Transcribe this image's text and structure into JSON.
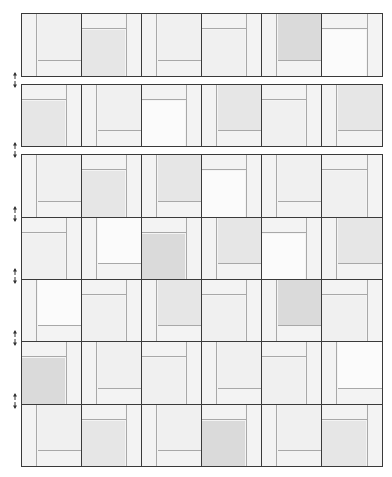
{
  "diagram": {
    "title": "",
    "colors": {
      "outline": "#3a3a3a",
      "seam": "#a8a8a8",
      "strip": "#f3f3f3",
      "shade_white": "#fbfbfb",
      "shade_light": "#f0f0f0",
      "shade_medium": "#e6e6e6",
      "shade_dark": "#dadada"
    },
    "rows": [
      {
        "top": 13,
        "height": 64,
        "blocks": [
          {
            "layout": "left-bottom",
            "fill": "shade_light"
          },
          {
            "layout": "top-right",
            "fill": "shade_medium"
          },
          {
            "layout": "left-bottom",
            "fill": "shade_light"
          },
          {
            "layout": "top-right",
            "fill": "shade_light"
          },
          {
            "layout": "left-bottom",
            "fill": "shade_dark"
          },
          {
            "layout": "top-right",
            "fill": "shade_white"
          }
        ]
      },
      {
        "top": 84,
        "height": 63,
        "blocks": [
          {
            "layout": "top-right",
            "fill": "shade_medium"
          },
          {
            "layout": "left-bottom",
            "fill": "shade_light"
          },
          {
            "layout": "top-right",
            "fill": "shade_white"
          },
          {
            "layout": "left-bottom",
            "fill": "shade_medium"
          },
          {
            "layout": "top-right",
            "fill": "shade_light"
          },
          {
            "layout": "left-bottom",
            "fill": "shade_medium"
          }
        ]
      },
      {
        "top": 154,
        "height": 64,
        "blocks": [
          {
            "layout": "left-bottom",
            "fill": "shade_light"
          },
          {
            "layout": "top-right",
            "fill": "shade_medium"
          },
          {
            "layout": "left-bottom",
            "fill": "shade_medium"
          },
          {
            "layout": "top-right",
            "fill": "shade_white"
          },
          {
            "layout": "left-bottom",
            "fill": "shade_light"
          },
          {
            "layout": "top-right",
            "fill": "shade_light"
          }
        ]
      },
      {
        "top": 217,
        "height": 63,
        "blocks": [
          {
            "layout": "top-right",
            "fill": "shade_light"
          },
          {
            "layout": "left-bottom",
            "fill": "shade_white"
          },
          {
            "layout": "top-right",
            "fill": "shade_dark"
          },
          {
            "layout": "left-bottom",
            "fill": "shade_medium"
          },
          {
            "layout": "top-right",
            "fill": "shade_white"
          },
          {
            "layout": "left-bottom",
            "fill": "shade_medium"
          }
        ]
      },
      {
        "top": 279,
        "height": 63,
        "blocks": [
          {
            "layout": "left-bottom",
            "fill": "shade_white"
          },
          {
            "layout": "top-right",
            "fill": "shade_light"
          },
          {
            "layout": "left-bottom",
            "fill": "shade_medium"
          },
          {
            "layout": "top-right",
            "fill": "shade_light"
          },
          {
            "layout": "left-bottom",
            "fill": "shade_dark"
          },
          {
            "layout": "top-right",
            "fill": "shade_light"
          }
        ]
      },
      {
        "top": 341,
        "height": 64,
        "blocks": [
          {
            "layout": "top-right",
            "fill": "shade_dark"
          },
          {
            "layout": "left-bottom",
            "fill": "shade_light"
          },
          {
            "layout": "top-right",
            "fill": "shade_light"
          },
          {
            "layout": "left-bottom",
            "fill": "shade_light"
          },
          {
            "layout": "top-right",
            "fill": "shade_light"
          },
          {
            "layout": "left-bottom",
            "fill": "shade_white"
          }
        ]
      },
      {
        "top": 404,
        "height": 63,
        "blocks": [
          {
            "layout": "left-bottom",
            "fill": "shade_light"
          },
          {
            "layout": "top-right",
            "fill": "shade_medium"
          },
          {
            "layout": "left-bottom",
            "fill": "shade_light"
          },
          {
            "layout": "top-right",
            "fill": "shade_dark"
          },
          {
            "layout": "left-bottom",
            "fill": "shade_light"
          },
          {
            "layout": "top-right",
            "fill": "shade_medium"
          }
        ]
      }
    ],
    "markers": [
      {
        "top": 72,
        "icon": "double-arrow-vertical-icon"
      },
      {
        "top": 142,
        "icon": "double-arrow-vertical-icon"
      },
      {
        "top": 206,
        "icon": "double-arrow-vertical-icon"
      },
      {
        "top": 268,
        "icon": "double-arrow-vertical-icon"
      },
      {
        "top": 330,
        "icon": "double-arrow-vertical-icon"
      },
      {
        "top": 393,
        "icon": "double-arrow-vertical-icon"
      }
    ]
  }
}
